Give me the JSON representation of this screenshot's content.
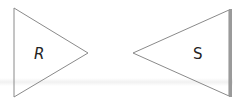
{
  "diagram": {
    "shapes": [
      {
        "id": "R",
        "label": "R",
        "type": "triangle",
        "direction": "right",
        "points": [
          [
            14,
            8
          ],
          [
            14,
            97
          ],
          [
            88,
            53
          ]
        ],
        "label_pos": [
          40,
          59
        ]
      },
      {
        "id": "S",
        "label": "S",
        "type": "triangle",
        "direction": "left",
        "points": [
          [
            133,
            53
          ],
          [
            229,
            10
          ],
          [
            229,
            96
          ]
        ],
        "label_pos": [
          197,
          59
        ]
      }
    ],
    "colors": {
      "stroke": "#8a8a8a",
      "text": "#222222",
      "edge_accent": "#9a9a9a"
    }
  }
}
